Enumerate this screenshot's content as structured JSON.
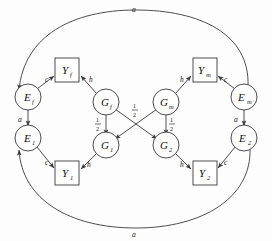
{
  "diagram": {
    "stroke_color": "#3a3a3a",
    "node_fill": "#ffffff",
    "label_color": "#111111",
    "nodes": [
      {
        "id": "E_f",
        "shape": "circle",
        "label": "E",
        "sub": "f",
        "x": 28,
        "y": 97
      },
      {
        "id": "E_1",
        "shape": "circle",
        "label": "E",
        "sub": "1",
        "x": 28,
        "y": 138
      },
      {
        "id": "Y_f",
        "shape": "box",
        "label": "Y",
        "sub": "f",
        "x": 67,
        "y": 70
      },
      {
        "id": "Y_1",
        "shape": "box",
        "label": "Y",
        "sub": "1",
        "x": 67,
        "y": 173
      },
      {
        "id": "G_f",
        "shape": "circle",
        "label": "G",
        "sub": "f",
        "x": 106,
        "y": 102
      },
      {
        "id": "G_m",
        "shape": "circle",
        "label": "G",
        "sub": "m",
        "x": 166,
        "y": 102
      },
      {
        "id": "G_1",
        "shape": "circle",
        "label": "G",
        "sub": "1",
        "x": 106,
        "y": 145
      },
      {
        "id": "G_2",
        "shape": "circle",
        "label": "G",
        "sub": "2",
        "x": 166,
        "y": 145
      },
      {
        "id": "Y_m",
        "shape": "box",
        "label": "Y",
        "sub": "m",
        "x": 205,
        "y": 70
      },
      {
        "id": "Y_2",
        "shape": "box",
        "label": "Y",
        "sub": "2",
        "x": 205,
        "y": 173
      },
      {
        "id": "E_m",
        "shape": "circle",
        "label": "E",
        "sub": "m",
        "x": 244,
        "y": 97
      },
      {
        "id": "E_2",
        "shape": "circle",
        "label": "E",
        "sub": "2",
        "x": 244,
        "y": 138
      }
    ],
    "edges": [
      {
        "from": "E_f",
        "to": "Y_f",
        "label": "c",
        "type": "arrow"
      },
      {
        "from": "G_f",
        "to": "Y_f",
        "label": "h",
        "type": "arrow"
      },
      {
        "from": "E_1",
        "to": "Y_1",
        "label": "c",
        "type": "arrow"
      },
      {
        "from": "G_1",
        "to": "Y_1",
        "label": "h",
        "type": "arrow"
      },
      {
        "from": "E_m",
        "to": "Y_m",
        "label": "c",
        "type": "arrow"
      },
      {
        "from": "G_m",
        "to": "Y_m",
        "label": "h",
        "type": "arrow"
      },
      {
        "from": "E_2",
        "to": "Y_2",
        "label": "c",
        "type": "arrow"
      },
      {
        "from": "G_2",
        "to": "Y_2",
        "label": "h",
        "type": "arrow"
      },
      {
        "from": "E_f",
        "to": "E_1",
        "label": "a",
        "type": "double-arrow"
      },
      {
        "from": "E_m",
        "to": "E_2",
        "label": "a",
        "type": "double-arrow"
      },
      {
        "from": "G_f",
        "to": "G_1",
        "label": "1/2",
        "type": "arrow"
      },
      {
        "from": "G_m",
        "to": "G_2",
        "label": "1/2",
        "type": "arrow"
      },
      {
        "from": "G_f",
        "to": "G_2",
        "label": "1/2",
        "type": "arrow"
      },
      {
        "from": "G_m",
        "to": "G_1",
        "label": "1/2",
        "type": "arrow"
      },
      {
        "from": "E_m",
        "to": "E_f",
        "label": "a",
        "type": "curve-top"
      },
      {
        "from": "E_2",
        "to": "E_1",
        "label": "a",
        "type": "curve-bottom"
      }
    ],
    "edge_labels": {
      "c": "c",
      "h": "h",
      "a": "a",
      "half_numerator": "1",
      "half_denominator": "2"
    }
  }
}
